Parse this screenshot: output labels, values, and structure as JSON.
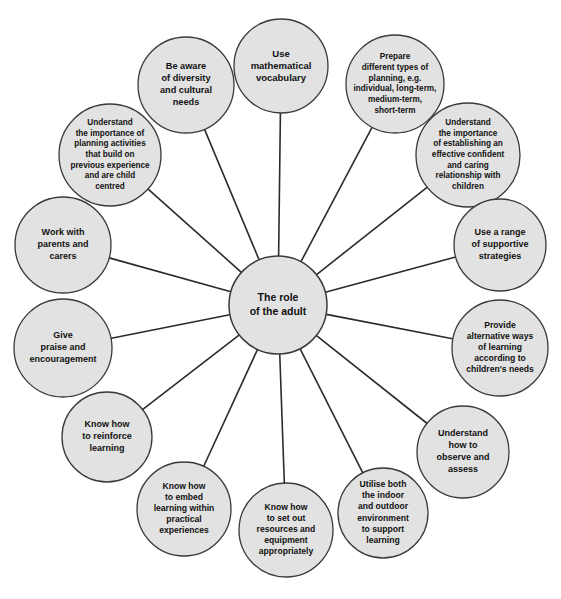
{
  "diagram": {
    "type": "radial-mind-map",
    "center": {
      "label": "The role\nof the adult",
      "lines": [
        "The role",
        "of the adult"
      ],
      "cx": 278,
      "cy": 305,
      "r": 49
    },
    "colors": {
      "node_fill": "#e2e2e2",
      "node_stroke": "#3a3a3a",
      "connector": "#2b2b2b",
      "text": "#111111",
      "background": "#ffffff"
    },
    "nodes": [
      {
        "id": "use-mathematical-vocabulary",
        "label": "Use mathematical vocabulary",
        "lines": [
          "Use",
          "mathematical",
          "vocabulary"
        ],
        "cx": 281,
        "cy": 66,
        "r": 47,
        "font_size": 9.5
      },
      {
        "id": "prepare-different-types-of-planning",
        "label": "Prepare different types of planning, e.g. individual, long-term, medium-term, short-term",
        "lines": [
          "Prepare",
          "different types of",
          "planning, e.g.",
          "individual, long-term,",
          "medium-term,",
          "short-term"
        ],
        "cx": 395,
        "cy": 84,
        "r": 49,
        "font_size": 8.2
      },
      {
        "id": "understand-importance-of-establishing-relationship",
        "label": "Understand the importance of establishing an effective confident and caring relationship with children",
        "lines": [
          "Understand",
          "the importance",
          "of establishing an",
          "effective confident",
          "and caring",
          "relationship with",
          "children"
        ],
        "cx": 468,
        "cy": 155,
        "r": 52,
        "font_size": 8.2
      },
      {
        "id": "use-a-range-of-supportive-strategies",
        "label": "Use a range of supportive strategies",
        "lines": [
          "Use a range",
          "of supportive",
          "strategies"
        ],
        "cx": 500,
        "cy": 245,
        "r": 46,
        "font_size": 9
      },
      {
        "id": "provide-alternative-ways-of-learning",
        "label": "Provide alternative ways of learning according to children's needs",
        "lines": [
          "Provide",
          "alternative ways",
          "of learning",
          "according to",
          "children's needs"
        ],
        "cx": 500,
        "cy": 348,
        "r": 48,
        "font_size": 8.6
      },
      {
        "id": "understand-how-to-observe-and-assess",
        "label": "Understand how to observe and assess",
        "lines": [
          "Understand",
          "how to",
          "observe and",
          "assess"
        ],
        "cx": 463,
        "cy": 452,
        "r": 46,
        "font_size": 9
      },
      {
        "id": "utilise-both-indoor-and-outdoor-environment",
        "label": "Utilise both the indoor and outdoor environment to support learning",
        "lines": [
          "Utilise both",
          "the indoor",
          "and outdoor",
          "environment",
          "to support",
          "learning"
        ],
        "cx": 383,
        "cy": 513,
        "r": 45,
        "font_size": 8.6
      },
      {
        "id": "know-how-to-set-out-resources",
        "label": "Know how to set out resources and equipment appropriately",
        "lines": [
          "Know how",
          "to set out",
          "resources and",
          "equipment",
          "appropriately"
        ],
        "cx": 286,
        "cy": 530,
        "r": 47,
        "font_size": 8.6
      },
      {
        "id": "know-how-to-embed-learning",
        "label": "Know how to embed learning within practical experiences",
        "lines": [
          "Know how",
          "to embed",
          "learning within",
          "practical",
          "experiences"
        ],
        "cx": 184,
        "cy": 509,
        "r": 47,
        "font_size": 8.6
      },
      {
        "id": "know-how-to-reinforce-learning",
        "label": "Know how to reinforce learning",
        "lines": [
          "Know how",
          "to reinforce",
          "learning"
        ],
        "cx": 107,
        "cy": 437,
        "r": 45,
        "font_size": 9
      },
      {
        "id": "give-praise-and-encouragement",
        "label": "Give praise and encouragement",
        "lines": [
          "Give",
          "praise and",
          "encouragement"
        ],
        "cx": 63,
        "cy": 348,
        "r": 49,
        "font_size": 9
      },
      {
        "id": "work-with-parents-and-carers",
        "label": "Work with parents and carers",
        "lines": [
          "Work with",
          "parents and",
          "carers"
        ],
        "cx": 63,
        "cy": 245,
        "r": 48,
        "font_size": 9
      },
      {
        "id": "understand-importance-of-planning-activities",
        "label": "Understand the importance of planning activities that build on previous experience and are child centred",
        "lines": [
          "Understand",
          "the importance of",
          "planning activities",
          "that build on",
          "previous experience",
          "and are child",
          "centred"
        ],
        "cx": 110,
        "cy": 155,
        "r": 51,
        "font_size": 8.2
      },
      {
        "id": "be-aware-of-diversity-and-cultural-needs",
        "label": "Be aware of diversity and cultural needs",
        "lines": [
          "Be aware",
          "of diversity",
          "and cultural",
          "needs"
        ],
        "cx": 186,
        "cy": 85,
        "r": 48,
        "font_size": 9.2
      }
    ]
  }
}
